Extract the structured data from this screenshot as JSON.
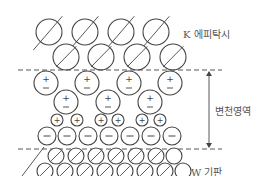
{
  "labels": {
    "top_layer": "K 에피탁시",
    "transition": "변천영역",
    "substrate": "W 기판"
  },
  "colors": {
    "stroke": "#444444",
    "text": "#555555"
  },
  "symbols": {
    "plus": "+",
    "minus": "−"
  },
  "geometry": {
    "k_rows": [
      {
        "y": 32,
        "r": 13,
        "xs": [
          49,
          85,
          121,
          156
        ]
      },
      {
        "y": 57,
        "r": 13,
        "xs": [
          66,
          101,
          137,
          173
        ]
      }
    ],
    "dipole_rows": [
      {
        "y": 83,
        "r": 12,
        "xs": [
          46,
          87,
          129,
          170
        ]
      },
      {
        "y": 102,
        "r": 12,
        "xs": [
          66,
          108,
          150
        ]
      }
    ],
    "plus_row": {
      "y": 120,
      "r": 6,
      "xs": [
        57,
        77,
        101,
        118,
        142,
        160
      ]
    },
    "minus_row": {
      "y": 136,
      "r": 9,
      "xs": [
        47,
        67,
        88,
        109,
        130,
        151,
        172
      ]
    },
    "w_rows": [
      {
        "y": 156,
        "r": 8,
        "xs": [
          56,
          76,
          96,
          116,
          136,
          156,
          174
        ]
      },
      {
        "y": 171,
        "r": 8,
        "xs": [
          45,
          65,
          85,
          105,
          125,
          145,
          165,
          183
        ]
      }
    ],
    "dash_top_y": 70,
    "dash_bottom_y": 149
  }
}
